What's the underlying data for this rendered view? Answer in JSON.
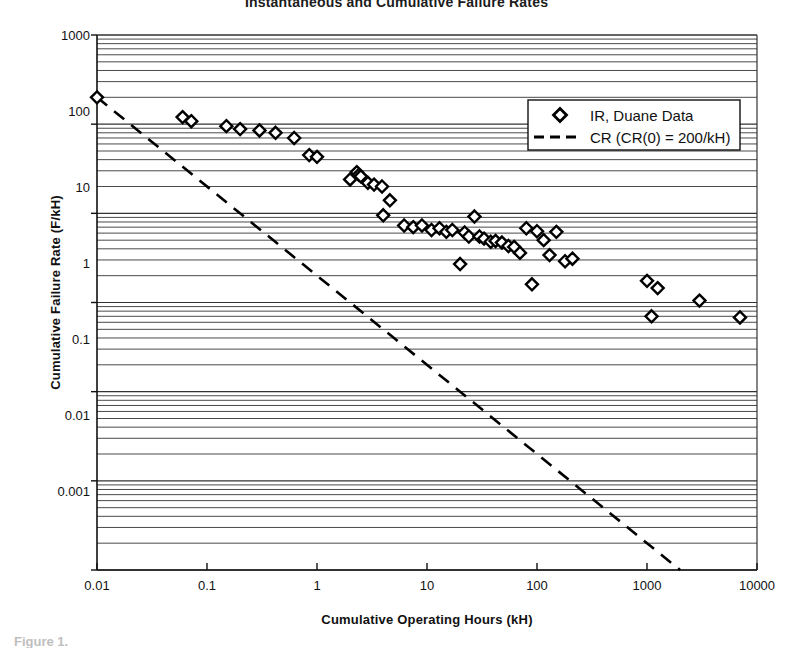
{
  "figure": {
    "title": "Instantaneous and Cumulative Failure Rates",
    "caption": "Figure 1."
  },
  "chart_data": {
    "type": "scatter",
    "title": "Instantaneous and Cumulative Failure Rates",
    "xlabel": "Cumulative Operating Hours (kH)",
    "ylabel": "Cumulative Failure Rate (F/kH)",
    "xscale": "log",
    "yscale": "log",
    "xlim": [
      0.01,
      10000
    ],
    "ylim": [
      0.001,
      1000
    ],
    "xticks": [
      "0.01",
      "0.1",
      "1",
      "10",
      "100",
      "1000",
      "10000"
    ],
    "yticks": [
      "1000",
      "100",
      "10",
      "1",
      "0.1",
      "0.01",
      "0.001"
    ],
    "grid": "horizontal-major-and-minor",
    "legend_position": "upper-right",
    "series": [
      {
        "name": "IR, Duane Data",
        "marker": "diamond-open",
        "type": "scatter",
        "color": "#000000",
        "points": [
          [
            0.01,
            200
          ],
          [
            0.06,
            120
          ],
          [
            0.072,
            108
          ],
          [
            0.15,
            95
          ],
          [
            0.2,
            88
          ],
          [
            0.3,
            85
          ],
          [
            0.42,
            80
          ],
          [
            0.62,
            70
          ],
          [
            0.85,
            45
          ],
          [
            1.0,
            43
          ],
          [
            2.0,
            24
          ],
          [
            2.3,
            29
          ],
          [
            2.4,
            27
          ],
          [
            2.5,
            26
          ],
          [
            2.9,
            22
          ],
          [
            3.3,
            21
          ],
          [
            3.9,
            20
          ],
          [
            4.6,
            14
          ],
          [
            4.0,
            9.5
          ],
          [
            6.2,
            7.3
          ],
          [
            7.5,
            7.0
          ],
          [
            9.0,
            7.3
          ],
          [
            11.0,
            6.5
          ],
          [
            13.0,
            6.8
          ],
          [
            15.0,
            6.2
          ],
          [
            17.0,
            6.5
          ],
          [
            20.0,
            2.7
          ],
          [
            22.0,
            6.1
          ],
          [
            24.0,
            5.5
          ],
          [
            27.0,
            9.2
          ],
          [
            30.0,
            5.5
          ],
          [
            33.0,
            5.2
          ],
          [
            38.0,
            4.8
          ],
          [
            42.0,
            4.9
          ],
          [
            48.0,
            4.7
          ],
          [
            55.0,
            4.3
          ],
          [
            62.0,
            4.2
          ],
          [
            70.0,
            3.6
          ],
          [
            80.0,
            6.8
          ],
          [
            90.0,
            1.6
          ],
          [
            100.0,
            6.3
          ],
          [
            115.0,
            5.0
          ],
          [
            130.0,
            3.4
          ],
          [
            150.0,
            6.2
          ],
          [
            180.0,
            2.9
          ],
          [
            210.0,
            3.1
          ],
          [
            1000.0,
            1.75
          ],
          [
            1100.0,
            0.7
          ],
          [
            1250.0,
            1.45
          ],
          [
            3000.0,
            1.05
          ],
          [
            7000.0,
            0.68
          ]
        ]
      },
      {
        "name": "CR (CR(0) = 200/kH)",
        "type": "line",
        "style": "dashed",
        "color": "#000000",
        "points": [
          [
            0.01,
            200
          ],
          [
            2000,
            0.001
          ]
        ]
      }
    ],
    "legend": [
      {
        "label": "IR, Duane Data",
        "marker": "diamond-open"
      },
      {
        "label": "CR (CR(0) = 200/kH)",
        "marker": "dashed-line"
      }
    ]
  }
}
